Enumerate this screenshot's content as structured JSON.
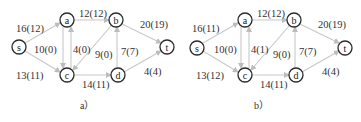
{
  "diagrams": [
    {
      "caption": "a）",
      "nodes": {
        "s": "s",
        "a": "a",
        "b": "b",
        "c": "c",
        "d": "d",
        "t": "t"
      },
      "edges": {
        "sa": "16(12)",
        "sc": "13(11)",
        "ac": "10(0)",
        "ca": "4(0)",
        "ab": "12(12)",
        "bc": "9(0)",
        "cd": "14(11)",
        "db": "7(7)",
        "bt": "20(19)",
        "dt": "4(4)"
      }
    },
    {
      "caption": "b）",
      "nodes": {
        "s": "s",
        "a": "a",
        "b": "b",
        "c": "c",
        "d": "d",
        "t": "t"
      },
      "edges": {
        "sa": "16(11)",
        "sc": "13(12)",
        "ac": "10(0)",
        "ca": "4(1)",
        "ab": "12(12)",
        "bc": "9(0)",
        "cd": "14(11)",
        "db": "7(7)",
        "bt": "20(19)",
        "dt": "4(4)"
      }
    }
  ],
  "colors": {
    "edge": "#c8c8c8",
    "node_stroke": "#2a2a2a",
    "text": "#333333"
  }
}
